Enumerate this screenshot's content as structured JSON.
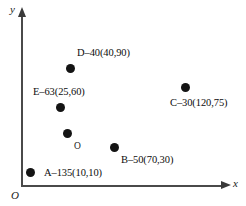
{
  "figure": {
    "background_color": "#ffffff",
    "axis_color": "#4a4a4a",
    "point_color": "#141414",
    "axes": {
      "y_label": "y",
      "x_label": "x",
      "origin_label": "O"
    },
    "center_marker": {
      "label": "O",
      "px": 67,
      "py": 133
    }
  },
  "chart_data": {
    "type": "scatter",
    "title": "",
    "xlabel": "x",
    "ylabel": "y",
    "grid": false,
    "legend": "none",
    "axis_arrows": true,
    "origin_label": "O",
    "xlim": [
      0,
      140
    ],
    "ylim": [
      0,
      100
    ],
    "points": [
      {
        "name": "A",
        "label": "A–135(10,10)",
        "angle": 135,
        "x": 10,
        "y": 10,
        "px": 30,
        "py": 172,
        "label_px": 44,
        "label_py": 168
      },
      {
        "name": "B",
        "label": "B–50(70,30)",
        "angle": 50,
        "x": 70,
        "y": 30,
        "px": 114,
        "py": 147,
        "label_px": 121,
        "label_py": 155
      },
      {
        "name": "C",
        "label": "C–30(120,75)",
        "angle": 30,
        "x": 120,
        "y": 75,
        "px": 185,
        "py": 87,
        "label_px": 170,
        "label_py": 98
      },
      {
        "name": "D",
        "label": "D–40(40,90)",
        "angle": 40,
        "x": 40,
        "y": 90,
        "px": 70,
        "py": 68,
        "label_px": 77,
        "label_py": 48
      },
      {
        "name": "E",
        "label": "E–63(25,60)",
        "angle": 63,
        "x": 25,
        "y": 60,
        "px": 60,
        "py": 107,
        "label_px": 33,
        "label_py": 87
      }
    ]
  }
}
